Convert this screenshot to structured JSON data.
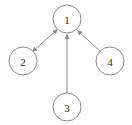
{
  "diagram": {
    "type": "directed-graph",
    "background_color": "#ffffff",
    "node_stroke_color": "#8a8a8a",
    "node_fill_color": "#ffffff",
    "edge_color": "#8a8a8a",
    "label_color": "#2b2b2b",
    "nodes": [
      {
        "id": "1",
        "label": "1",
        "cx": 67,
        "cy": 19,
        "r": 14
      },
      {
        "id": "2",
        "label": "2",
        "cx": 23,
        "cy": 61,
        "r": 14
      },
      {
        "id": "3",
        "label": "3",
        "cx": 67,
        "cy": 107,
        "r": 14
      },
      {
        "id": "4",
        "label": "4",
        "cx": 110,
        "cy": 61,
        "r": 14
      }
    ],
    "edges": [
      {
        "from": "1",
        "to": "2",
        "direction": "bidirectional",
        "arrowheads": 2
      },
      {
        "from": "3",
        "to": "1",
        "direction": "directed",
        "arrowheads": 1
      },
      {
        "from": "4",
        "to": "1",
        "direction": "directed",
        "arrowheads": 1
      }
    ]
  }
}
